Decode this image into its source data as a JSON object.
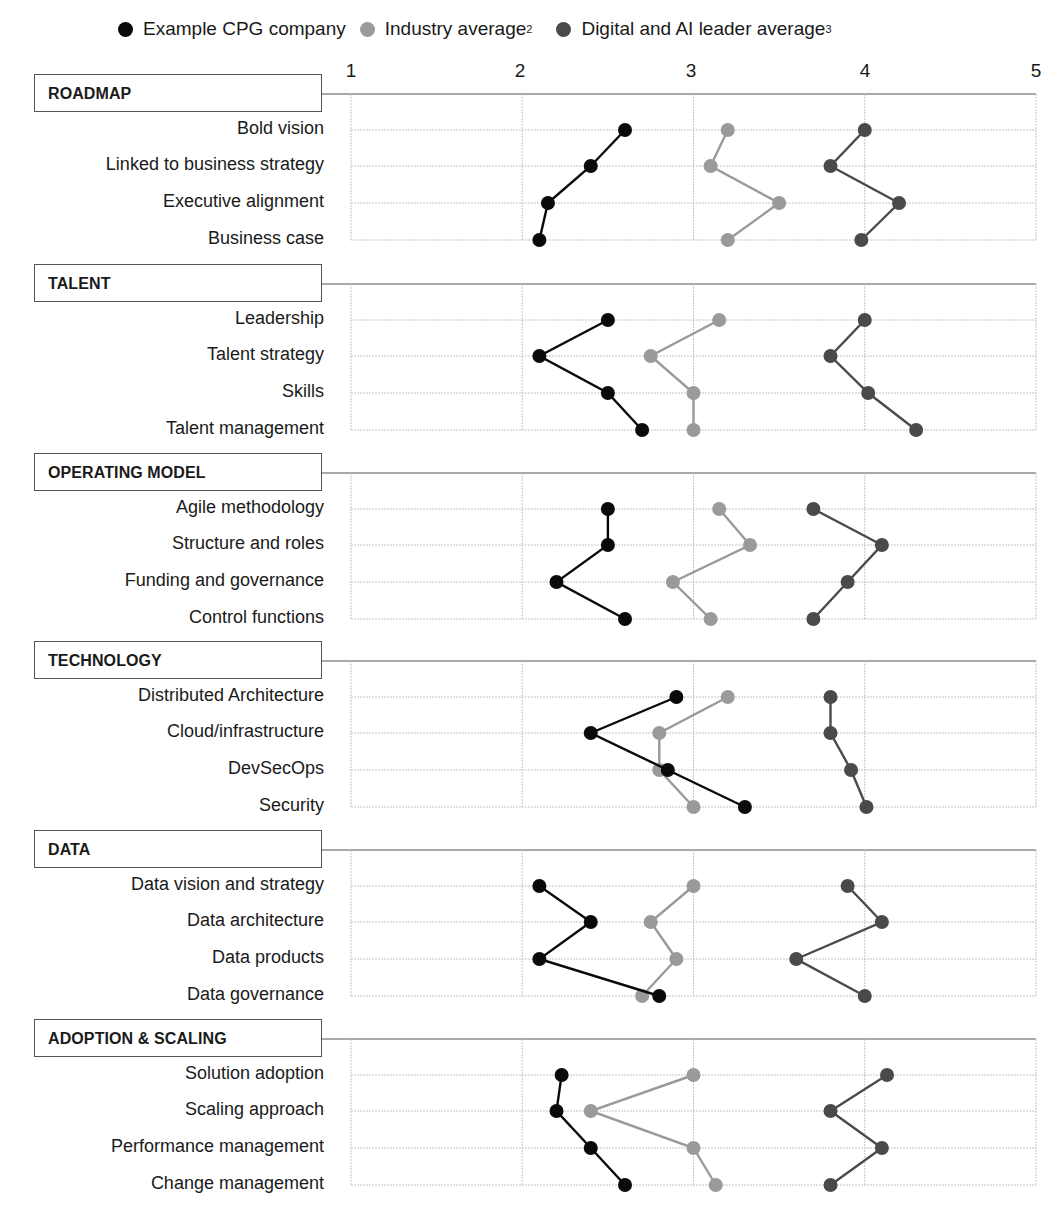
{
  "chart_data": {
    "type": "line",
    "orientation": "horizontal-dot-plot",
    "title": "",
    "xlabel": "",
    "ylabel": "",
    "xlim": [
      1,
      5
    ],
    "x_ticks": [
      "1",
      "2",
      "3",
      "4",
      "5"
    ],
    "grid": true,
    "legend_position": "top",
    "legend": [
      {
        "name": "Example CPG company",
        "sup": "",
        "color": "#0a0a0a"
      },
      {
        "name": "Industry average",
        "sup": "2",
        "color": "#9a9a9a"
      },
      {
        "name": "Digital and AI leader average",
        "sup": "3",
        "color": "#4a4a4a"
      }
    ],
    "sections": [
      {
        "title": "ROADMAP",
        "categories": [
          "Bold vision",
          "Linked to business strategy",
          "Executive alignment",
          "Business case"
        ],
        "series": [
          {
            "name": "Example CPG company",
            "values": [
              2.6,
              2.4,
              2.15,
              2.1
            ]
          },
          {
            "name": "Industry average",
            "values": [
              3.2,
              3.1,
              3.5,
              3.2
            ]
          },
          {
            "name": "Digital and AI leader average",
            "values": [
              4.0,
              3.8,
              4.2,
              3.98
            ]
          }
        ]
      },
      {
        "title": "TALENT",
        "categories": [
          "Leadership",
          "Talent strategy",
          "Skills",
          "Talent management"
        ],
        "series": [
          {
            "name": "Example CPG company",
            "values": [
              2.5,
              2.1,
              2.5,
              2.7
            ]
          },
          {
            "name": "Industry average",
            "values": [
              3.15,
              2.75,
              3.0,
              3.0
            ]
          },
          {
            "name": "Digital and AI leader average",
            "values": [
              4.0,
              3.8,
              4.02,
              4.3
            ]
          }
        ]
      },
      {
        "title": "OPERATING MODEL",
        "categories": [
          "Agile methodology",
          "Structure and roles",
          "Funding and governance",
          "Control functions"
        ],
        "series": [
          {
            "name": "Example CPG company",
            "values": [
              2.5,
              2.5,
              2.2,
              2.6
            ]
          },
          {
            "name": "Industry average",
            "values": [
              3.15,
              3.33,
              2.88,
              3.1
            ]
          },
          {
            "name": "Digital and AI leader average",
            "values": [
              3.7,
              4.1,
              3.9,
              3.7
            ]
          }
        ]
      },
      {
        "title": "TECHNOLOGY",
        "categories": [
          "Distributed Architecture",
          "Cloud/infrastructure",
          "DevSecOps",
          "Security"
        ],
        "series": [
          {
            "name": "Example CPG company",
            "values": [
              2.9,
              2.4,
              2.85,
              3.3
            ]
          },
          {
            "name": "Industry average",
            "values": [
              3.2,
              2.8,
              2.8,
              3.0
            ]
          },
          {
            "name": "Digital and AI leader average",
            "values": [
              3.8,
              3.8,
              3.92,
              4.01
            ]
          }
        ]
      },
      {
        "title": "DATA",
        "categories": [
          "Data vision and strategy",
          "Data architecture",
          "Data products",
          "Data governance"
        ],
        "series": [
          {
            "name": "Example CPG company",
            "values": [
              2.1,
              2.4,
              2.1,
              2.8
            ]
          },
          {
            "name": "Industry average",
            "values": [
              3.0,
              2.75,
              2.9,
              2.7
            ]
          },
          {
            "name": "Digital and AI leader average",
            "values": [
              3.9,
              4.1,
              3.6,
              4.0
            ]
          }
        ]
      },
      {
        "title": "ADOPTION & SCALING",
        "categories": [
          "Solution adoption",
          "Scaling approach",
          "Performance management",
          "Change management"
        ],
        "series": [
          {
            "name": "Example CPG company",
            "values": [
              2.23,
              2.2,
              2.4,
              2.6
            ]
          },
          {
            "name": "Industry average",
            "values": [
              3.0,
              2.4,
              3.0,
              3.13
            ]
          },
          {
            "name": "Digital and AI leader average",
            "values": [
              4.13,
              3.8,
              4.1,
              3.8
            ]
          }
        ]
      }
    ]
  }
}
